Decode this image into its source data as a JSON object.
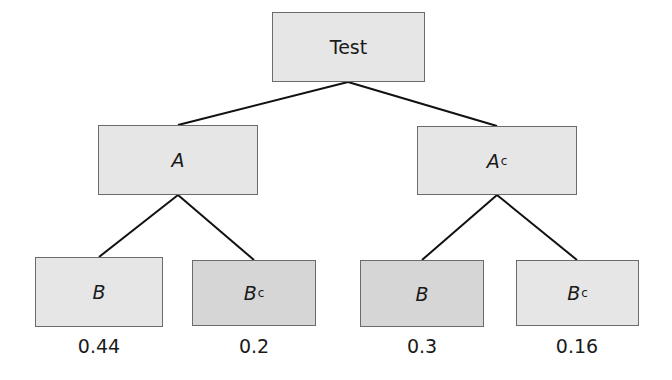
{
  "diagram": {
    "type": "probability-tree",
    "root": {
      "label": "Test"
    },
    "level1": [
      {
        "label": "A",
        "superscript": ""
      },
      {
        "label": "A",
        "superscript": "c"
      }
    ],
    "leaves": [
      {
        "label": "B",
        "superscript": "",
        "probability": "0.44"
      },
      {
        "label": "B",
        "superscript": "c",
        "probability": "0.2"
      },
      {
        "label": "B",
        "superscript": "",
        "probability": "0.3"
      },
      {
        "label": "B",
        "superscript": "c",
        "probability": "0.16"
      }
    ],
    "colors": {
      "light_fill": "#e6e6e6",
      "dark_fill": "#d6d6d6",
      "border": "#6b6b6b",
      "edge": "#111111"
    }
  }
}
